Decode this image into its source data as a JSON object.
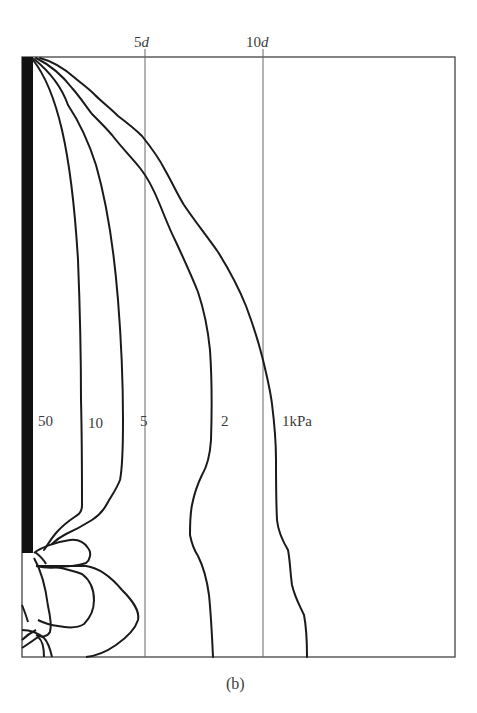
{
  "figure": {
    "caption": "(b)",
    "reference_lines": [
      {
        "num": "5",
        "unit": "d"
      },
      {
        "num": "10",
        "unit": "d"
      }
    ],
    "contour_labels": [
      "50",
      "10",
      "5",
      "2",
      "1kPa"
    ],
    "colors": {
      "contour": "#1a1a1a",
      "frame": "#444444",
      "reference_line": "#666666",
      "pile": "#111111",
      "text": "#3a3a3a"
    }
  }
}
